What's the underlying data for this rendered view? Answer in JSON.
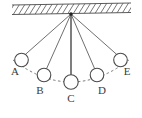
{
  "figure": {
    "background_color": "#ffffff",
    "line_color": "#555555",
    "ball_stroke_color": "#4a4a4a",
    "ball_fill_color": "#ffffff",
    "arc_color": "#6b6b6b",
    "label_color": "#3a3a3a",
    "hatch_color": "#4a4a4a"
  },
  "ceiling": {
    "name": "hatched support ceiling",
    "left_x": 12,
    "right_x": 131,
    "top_left_y": 5,
    "top_right_y": 3,
    "bottom_left_y": 14.5,
    "bottom_right_y": 12.5,
    "hatch_count": 22
  },
  "pivot": {
    "label": "",
    "x": 71,
    "y": 14
  },
  "balls": [
    {
      "id": "A",
      "label": "A",
      "cx": 21.5,
      "cy": 60,
      "r": 6.8,
      "label_x": 15,
      "label_y": 75,
      "string_highlight": false
    },
    {
      "id": "B",
      "label": "B",
      "cx": 44.0,
      "cy": 75,
      "r": 6.8,
      "label_x": 40,
      "label_y": 94,
      "string_highlight": false
    },
    {
      "id": "C",
      "label": "C",
      "cx": 71.0,
      "cy": 82,
      "r": 7.2,
      "label_x": 71,
      "label_y": 102,
      "string_highlight": true
    },
    {
      "id": "D",
      "label": "D",
      "cx": 97.0,
      "cy": 75,
      "r": 6.8,
      "label_x": 102,
      "label_y": 94,
      "string_highlight": false
    },
    {
      "id": "E",
      "label": "E",
      "cx": 120.5,
      "cy": 60,
      "r": 6.8,
      "label_x": 127,
      "label_y": 75,
      "string_highlight": false
    }
  ],
  "arc": {
    "name": "dashed swing path",
    "path": "M 13 60 Q 71 104 129 60",
    "dash": "2.5 2.5"
  },
  "strings": [
    {
      "to": "A",
      "x1": 71,
      "y1": 14,
      "x2": 25.2,
      "y2": 54.6
    },
    {
      "to": "B",
      "x1": 71,
      "y1": 14,
      "x2": 46.6,
      "y2": 68.6
    },
    {
      "to": "C",
      "x1": 71,
      "y1": 14,
      "x2": 71.0,
      "y2": 74.9
    },
    {
      "to": "D",
      "x1": 71,
      "y1": 14,
      "x2": 94.6,
      "y2": 68.6
    },
    {
      "to": "E",
      "x1": 71,
      "y1": 14,
      "x2": 116.9,
      "y2": 54.6
    }
  ]
}
